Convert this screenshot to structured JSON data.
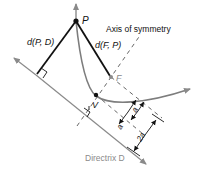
{
  "diagram": {
    "labels": {
      "point_p": "P",
      "point_f": "F",
      "point_v": "V",
      "dist_pd": "d(P, D)",
      "dist_fp": "d(F, P)",
      "axis": "Axis of symmetry",
      "directrix": "Directrix D",
      "dim_a1": "a",
      "dim_a2": "a",
      "dim_2a": "2a"
    },
    "colors": {
      "black": "#111111",
      "gray": "#8a8a8a",
      "curve": "#7d7d7d"
    }
  }
}
